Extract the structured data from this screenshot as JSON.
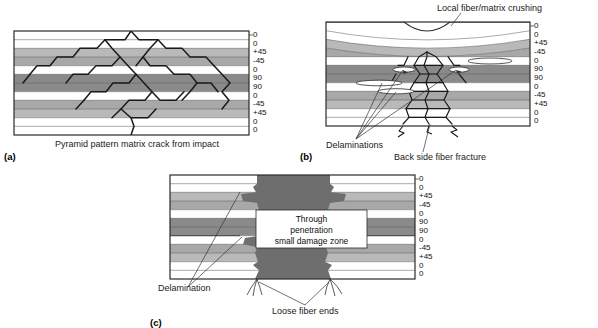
{
  "figure": {
    "ply_stack": [
      "0",
      "0",
      "+45",
      "-45",
      "0",
      "90",
      "90",
      "0",
      "-45",
      "+45",
      "0",
      "0"
    ],
    "colors": {
      "ply_0": "#ffffff",
      "ply_45": "#b9b9b9",
      "ply_45m": "#a8a8a8",
      "ply_90": "#8a8a8a",
      "damage_zone": "#6e6e6e",
      "outline": "#2b2b2b",
      "crack": "#1a1a1a"
    }
  },
  "panels": [
    {
      "id": "(a)",
      "caption": "Pyramid pattern matrix crack from impact",
      "labels": []
    },
    {
      "id": "(b)",
      "caption": "",
      "labels": [
        {
          "name": "local-crushing",
          "text": "Local fiber/matrix crushing"
        },
        {
          "name": "delaminations",
          "text": "Delaminations"
        },
        {
          "name": "back-side-fracture",
          "text": "Back side fiber fracture"
        }
      ]
    },
    {
      "id": "(c)",
      "caption": "",
      "labels": [
        {
          "name": "delamination",
          "text": "Delamination"
        },
        {
          "name": "loose-fiber-ends",
          "text": "Loose fiber ends"
        }
      ],
      "zone_text": [
        "Through",
        "penetration",
        "small damage zone"
      ]
    }
  ]
}
